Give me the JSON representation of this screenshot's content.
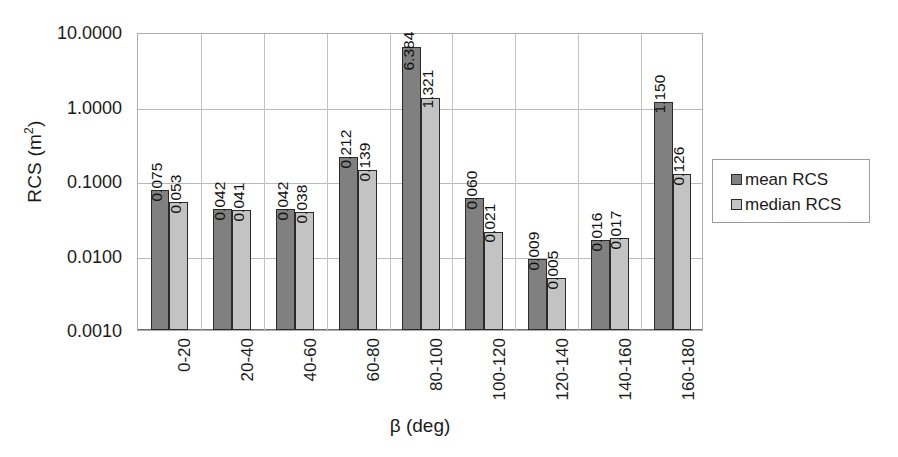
{
  "chart_data": {
    "type": "bar",
    "title": "",
    "xlabel": "β (deg)",
    "ylabel": "RCS (m²)",
    "ylabel_base": "RCS (m",
    "ylabel_sup": "2",
    "ylabel_tail": ")",
    "yscale": "log",
    "ylim": [
      0.001,
      10.0
    ],
    "ytick_labels": [
      "10.0000",
      "1.0000",
      "0.1000",
      "0.0100",
      "0.0010"
    ],
    "ytick_values": [
      10.0,
      1.0,
      0.1,
      0.01,
      0.001
    ],
    "grid": "horizontal-and-category-separators",
    "legend_position": "right",
    "categories": [
      "0-20",
      "20-40",
      "40-60",
      "60-80",
      "80-100",
      "100-120",
      "120-140",
      "140-160",
      "160-180"
    ],
    "series": [
      {
        "name": "mean RCS",
        "color": "#808080",
        "values": [
          0.075,
          0.042,
          0.042,
          0.212,
          6.384,
          0.06,
          0.009,
          0.016,
          1.15
        ],
        "labels": [
          "0.075",
          "0.042",
          "0.042",
          "0.212",
          "6.384",
          "0.060",
          "0.009",
          "0.016",
          "1.150"
        ]
      },
      {
        "name": "median RCS",
        "color": "#c3c3c3",
        "values": [
          0.053,
          0.041,
          0.038,
          0.139,
          1.321,
          0.021,
          0.005,
          0.017,
          0.126
        ],
        "labels": [
          "0.053",
          "0.041",
          "0.038",
          "0.139",
          "1.321",
          "0.021",
          "0.005",
          "0.017",
          "0.126"
        ]
      }
    ]
  },
  "legend": {
    "items": [
      {
        "label": "mean RCS",
        "swatch": "mean"
      },
      {
        "label": "median RCS",
        "swatch": "median"
      }
    ]
  }
}
